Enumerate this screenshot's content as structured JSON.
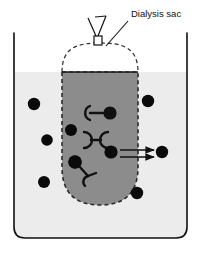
{
  "figure": {
    "width": 204,
    "height": 256,
    "background_color": "#ffffff"
  },
  "labels": [
    {
      "id": "dialysis-sac",
      "text": "Dialysis sac",
      "x": 131,
      "y": 17,
      "anchor": "start",
      "leader_line": {
        "x1": 128,
        "y1": 21,
        "x2": 106,
        "y2": 46
      }
    }
  ],
  "beaker": {
    "name": "beaker",
    "left_x": 14,
    "right_x": 187,
    "top_y": 33,
    "bottom_y": 238,
    "corner_radius": 11,
    "wall_color": "#111111",
    "wall_width": 1.6,
    "solvent_fill_color": "#ececec",
    "solvent_level_y": 72,
    "solvent_label": "solvent"
  },
  "sac": {
    "name": "dialysis-sac",
    "left_x": 62,
    "right_x": 138,
    "liquid_top_y": 72,
    "bottom_y": 205,
    "bottom_radius": 38,
    "dome_apex_y": 43,
    "fill_color": "#8c8c8c",
    "membrane_color": "#2b2b2b",
    "membrane_dash": "4 3",
    "membrane_width": 1.6,
    "clamp": {
      "name": "sac-clamp",
      "x": 94,
      "y": 36,
      "width": 8,
      "height": 9,
      "tie_left": {
        "x1": 88,
        "y1": 18,
        "x2": 96,
        "y2": 36
      },
      "tie_right": {
        "x1": 106,
        "y1": 16,
        "x2": 98,
        "y2": 36
      },
      "tie_top": {
        "x1": 106,
        "y1": 16,
        "x2": 95,
        "y2": 17
      }
    }
  },
  "small_molecules": {
    "name": "small-molecule-dots",
    "color": "#0a0a0a",
    "description": "small diffusible solute molecules",
    "outside": [
      {
        "cx": 34,
        "cy": 104,
        "r": 6.2
      },
      {
        "cx": 148,
        "cy": 101,
        "r": 6.2
      },
      {
        "cx": 47,
        "cy": 140,
        "r": 5.8
      },
      {
        "cx": 162,
        "cy": 152,
        "r": 6.2
      },
      {
        "cx": 44,
        "cy": 182,
        "r": 6.0
      },
      {
        "cx": 137,
        "cy": 193,
        "r": 6.2
      }
    ],
    "inside": [
      {
        "cx": 71,
        "cy": 130,
        "r": 6.0
      },
      {
        "cx": 75,
        "cy": 162,
        "r": 6.4
      },
      {
        "cx": 111,
        "cy": 152,
        "r": 6.6
      }
    ]
  },
  "macromolecules": {
    "name": "macromolecules",
    "color": "#111111",
    "description": "large non-diffusible branched macromolecules retained inside the sac",
    "items": [
      {
        "id": "macromolecule-1",
        "cx": 98,
        "cy": 113,
        "type": "arc-bar-ball"
      },
      {
        "id": "macromolecule-2",
        "cx": 96,
        "cy": 140,
        "type": "arc-bar-arc"
      },
      {
        "id": "macromolecule-3",
        "cx": 84,
        "cy": 172,
        "type": "ball-branch"
      }
    ]
  },
  "diffusion_arrows": {
    "name": "diffusion-arrows",
    "color": "#111111",
    "description": "small molecules diffusing out across the membrane",
    "count": 2,
    "arrows": [
      {
        "x1": 120,
        "y1": 150,
        "x2": 154,
        "y2": 150
      },
      {
        "x1": 120,
        "y1": 157,
        "x2": 154,
        "y2": 157
      }
    ]
  }
}
